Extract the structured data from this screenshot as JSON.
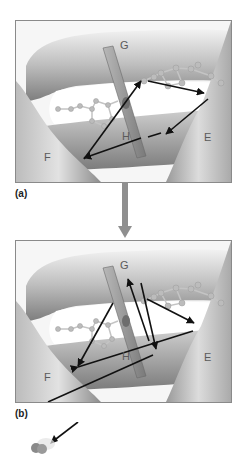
{
  "figure": {
    "panels": [
      {
        "id": "a",
        "label": "(a)",
        "helix_labels": {
          "E": "E",
          "F": "F",
          "G": "G",
          "H": "H"
        }
      },
      {
        "id": "b",
        "label": "(b)",
        "helix_labels": {
          "E": "E",
          "F": "F",
          "G": "G",
          "H": "H"
        }
      }
    ],
    "colors": {
      "helix_light": "#e6e6e6",
      "helix_dark": "#8c8c8c",
      "background_cavity": "#ffffff",
      "arrow": "#111111",
      "transition_arrow": "#8f8f8f",
      "ligand_atom": "#b5b5b5",
      "slab": "#9a9a9a"
    }
  }
}
